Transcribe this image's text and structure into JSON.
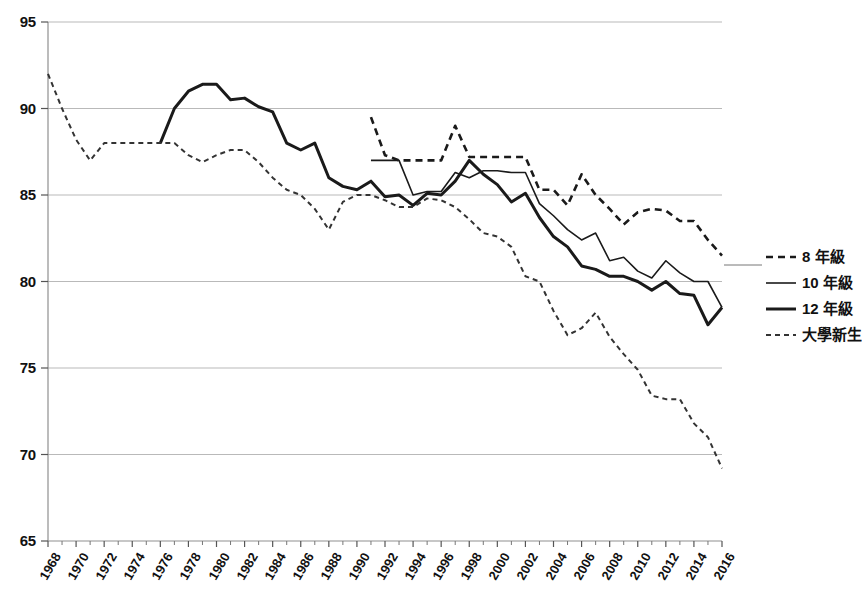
{
  "chart_data": {
    "type": "line",
    "title": "",
    "subtitle": "",
    "xlabel": "",
    "ylabel": "",
    "xlim": [
      1968,
      2016
    ],
    "ylim": [
      65,
      95
    ],
    "grid": true,
    "grid_axis": "y",
    "legend_position": "right",
    "y_ticks": [
      65,
      70,
      75,
      80,
      85,
      90,
      95
    ],
    "x_ticks": [
      1968,
      1970,
      1972,
      1974,
      1976,
      1978,
      1980,
      1982,
      1984,
      1986,
      1988,
      1990,
      1992,
      1994,
      1996,
      1998,
      2000,
      2002,
      2004,
      2006,
      2008,
      2010,
      2012,
      2014,
      2016
    ],
    "x_tick_labels": [
      "1968",
      "1970",
      "1972",
      "1974",
      "1976",
      "1978",
      "1980",
      "1982",
      "1984",
      "1986",
      "1988",
      "1990",
      "1992",
      "1994",
      "1996",
      "1998",
      "2000",
      "2002",
      "2004",
      "2006",
      "2008",
      "2010",
      "2012",
      "2014",
      "2016"
    ],
    "x_minor_ticks": [
      1969,
      1971,
      1973,
      1975,
      1977,
      1979,
      1981,
      1983,
      1985,
      1987,
      1989,
      1991,
      1993,
      1995,
      1997,
      1999,
      2001,
      2003,
      2005,
      2007,
      2009,
      2011,
      2013,
      2015
    ],
    "series": [
      {
        "name": "8 年級",
        "style": "dashed",
        "width": 2.6,
        "color": "#1a1a1a",
        "dash": "7,5",
        "x": [
          1991,
          1992,
          1993,
          1994,
          1995,
          1996,
          1997,
          1998,
          1999,
          2000,
          2001,
          2002,
          2003,
          2004,
          2005,
          2006,
          2007,
          2008,
          2009,
          2010,
          2011,
          2012,
          2013,
          2014,
          2015,
          2016
        ],
        "y": [
          89.5,
          87.3,
          87.0,
          87.0,
          87.0,
          87.0,
          89.0,
          87.2,
          87.2,
          87.2,
          87.2,
          87.2,
          85.3,
          85.3,
          84.4,
          86.2,
          85.0,
          84.2,
          83.3,
          84.0,
          84.2,
          84.1,
          83.5,
          83.5,
          82.4,
          81.5
        ]
      },
      {
        "name": "10 年級",
        "style": "solid",
        "width": 1.6,
        "color": "#1a1a1a",
        "dash": "",
        "x": [
          1991,
          1992,
          1993,
          1994,
          1995,
          1996,
          1997,
          1998,
          1999,
          2000,
          2001,
          2002,
          2003,
          2004,
          2005,
          2006,
          2007,
          2008,
          2009,
          2010,
          2011,
          2012,
          2013,
          2014,
          2015,
          2016
        ],
        "y": [
          87.0,
          87.0,
          87.0,
          85.0,
          85.2,
          85.2,
          86.3,
          86.0,
          86.4,
          86.4,
          86.3,
          86.3,
          84.5,
          83.8,
          83.0,
          82.4,
          82.8,
          81.2,
          81.4,
          80.6,
          80.2,
          81.2,
          80.5,
          80.0,
          80.0,
          78.5
        ]
      },
      {
        "name": "12 年級",
        "style": "solid",
        "width": 3.0,
        "color": "#1a1a1a",
        "dash": "",
        "x": [
          1976,
          1977,
          1978,
          1979,
          1980,
          1981,
          1982,
          1983,
          1984,
          1985,
          1986,
          1987,
          1988,
          1989,
          1990,
          1991,
          1992,
          1993,
          1994,
          1995,
          1996,
          1997,
          1998,
          1999,
          2000,
          2001,
          2002,
          2003,
          2004,
          2005,
          2006,
          2007,
          2008,
          2009,
          2010,
          2011,
          2012,
          2013,
          2014,
          2015,
          2016
        ],
        "y": [
          88.0,
          90.0,
          91.0,
          91.4,
          91.4,
          90.5,
          90.6,
          90.1,
          89.8,
          88.0,
          87.6,
          88.0,
          86.0,
          85.5,
          85.3,
          85.8,
          84.9,
          85.0,
          84.4,
          85.1,
          85.0,
          85.8,
          87.0,
          86.2,
          85.6,
          84.6,
          85.1,
          83.7,
          82.6,
          82.0,
          80.9,
          80.7,
          80.3,
          80.3,
          80.0,
          79.5,
          80.0,
          79.3,
          79.2,
          77.5,
          78.5
        ]
      },
      {
        "name": "大學新生",
        "style": "dotted-dash",
        "width": 2.0,
        "color": "#333333",
        "dash": "5,4",
        "x": [
          1968,
          1969,
          1970,
          1971,
          1972,
          1973,
          1974,
          1975,
          1976,
          1977,
          1978,
          1979,
          1980,
          1981,
          1982,
          1983,
          1984,
          1985,
          1986,
          1987,
          1988,
          1989,
          1990,
          1991,
          1992,
          1993,
          1994,
          1995,
          1996,
          1997,
          1998,
          1999,
          2000,
          2001,
          2002,
          2003,
          2004,
          2005,
          2006,
          2007,
          2008,
          2009,
          2010,
          2011,
          2012,
          2013,
          2014,
          2015,
          2016
        ],
        "y": [
          92.0,
          90.0,
          88.2,
          87.0,
          88.0,
          88.0,
          88.0,
          88.0,
          88.0,
          88.0,
          87.3,
          86.9,
          87.3,
          87.6,
          87.6,
          86.9,
          86.0,
          85.3,
          85.0,
          84.2,
          83.0,
          84.6,
          85.0,
          85.0,
          84.7,
          84.3,
          84.3,
          84.8,
          84.7,
          84.3,
          83.6,
          82.8,
          82.6,
          82.0,
          80.3,
          80.0,
          78.3,
          76.9,
          77.3,
          78.2,
          76.8,
          75.8,
          74.9,
          73.4,
          73.2,
          73.2,
          71.8,
          71.0,
          69.2
        ]
      }
    ]
  },
  "legend": {
    "entries": [
      {
        "label": "8 年級"
      },
      {
        "label": "10 年級"
      },
      {
        "label": "12 年級"
      },
      {
        "label": "大學新生"
      }
    ]
  }
}
